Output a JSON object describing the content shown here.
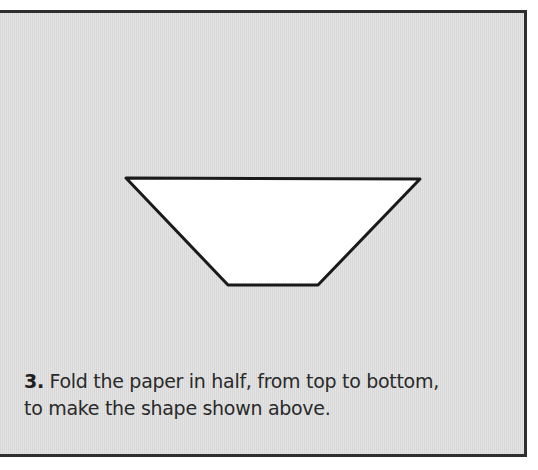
{
  "figure": {
    "background_color": "#dedede",
    "border_color": "#2f2f2f",
    "shape": {
      "type": "trapezoid",
      "fill": "#ffffff",
      "stroke": "#1a1a1a",
      "points": "126,178 420,179 318,285 228,285"
    }
  },
  "caption": {
    "step_number": "3.",
    "line1": "Fold the paper in half, from top to bottom,",
    "line2": "to make the shape shown above."
  }
}
